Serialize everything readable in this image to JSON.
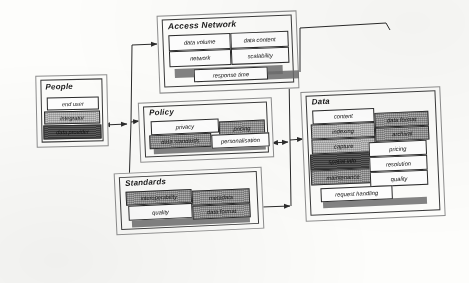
{
  "diagram": {
    "style": "scanned hand-drawn block diagram, skewed, italic labels",
    "colors": {
      "page_background": "#fdfdfb",
      "outline": "#2b2b2b",
      "outer_frame": "#8e8e8e",
      "fill_white": "#ffffff",
      "fill_light_gray": "#c9c9c9",
      "fill_mid_gray": "#b0b0b0",
      "fill_dark_gray": "#555555",
      "shadow": "#6d6d6d"
    }
  },
  "groups": {
    "people": {
      "title": "People",
      "items": [
        {
          "label": "end user",
          "fill": "white"
        },
        {
          "label": "integrator",
          "fill": "light"
        },
        {
          "label": "data provider",
          "fill": "dark"
        }
      ]
    },
    "access_network": {
      "title": "Access Network",
      "items": [
        {
          "label": "data volume",
          "fill": "white"
        },
        {
          "label": "data content",
          "fill": "white"
        },
        {
          "label": "network",
          "fill": "white"
        },
        {
          "label": "scalability",
          "fill": "white"
        },
        {
          "label": "response time",
          "fill": "white"
        }
      ]
    },
    "policy": {
      "title": "Policy",
      "items": [
        {
          "label": "privacy",
          "fill": "white"
        },
        {
          "label": "pricing",
          "fill": "mid"
        },
        {
          "label": "data standards",
          "fill": "mid"
        },
        {
          "label": "personalisation",
          "fill": "white"
        }
      ]
    },
    "standards": {
      "title": "Standards",
      "items": [
        {
          "label": "interoperability",
          "fill": "mid"
        },
        {
          "label": "metadata",
          "fill": "mid"
        },
        {
          "label": "quality",
          "fill": "white"
        },
        {
          "label": "data format",
          "fill": "mid"
        }
      ]
    },
    "data": {
      "title": "Data",
      "items": [
        {
          "label": "content",
          "fill": "white"
        },
        {
          "label": "data format",
          "fill": "mid"
        },
        {
          "label": "indexing",
          "fill": "light"
        },
        {
          "label": "archival",
          "fill": "mid"
        },
        {
          "label": "capture",
          "fill": "light"
        },
        {
          "label": "pricing",
          "fill": "white"
        },
        {
          "label": "spatial info",
          "fill": "dark"
        },
        {
          "label": "resolution",
          "fill": "white"
        },
        {
          "label": "maintenance",
          "fill": "mid"
        },
        {
          "label": "quality",
          "fill": "white"
        },
        {
          "label": "request handling",
          "fill": "white"
        }
      ]
    }
  },
  "connectors": [
    {
      "from": "people",
      "to": "trunk-left",
      "arrows": "both"
    },
    {
      "from": "trunk-left",
      "to": "access_network",
      "arrows": "to"
    },
    {
      "from": "trunk-left",
      "to": "policy",
      "arrows": "to"
    },
    {
      "from": "trunk-left",
      "to": "standards",
      "arrows": "to"
    },
    {
      "from": "policy",
      "to": "trunk-right",
      "arrows": "both"
    },
    {
      "from": "standards",
      "to": "trunk-right",
      "arrows": "to"
    },
    {
      "from": "access_network",
      "to": "trunk-right",
      "arrows": "to"
    },
    {
      "from": "trunk-right",
      "to": "data",
      "arrows": "to"
    }
  ]
}
